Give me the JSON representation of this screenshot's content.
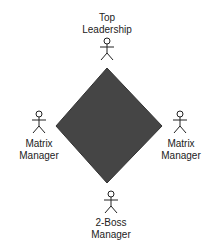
{
  "diagram": {
    "shape": "diamond",
    "fill_color": "#454545",
    "nodes": [
      {
        "id": "top",
        "role": "Top Leadership",
        "lines": [
          "Top",
          "Leadership"
        ],
        "icon": "stick-figure-icon"
      },
      {
        "id": "left",
        "role": "Matrix Manager",
        "lines": [
          "Matrix",
          "Manager"
        ],
        "icon": "stick-figure-icon"
      },
      {
        "id": "right",
        "role": "Matrix Manager",
        "lines": [
          "Matrix",
          "Manager"
        ],
        "icon": "stick-figure-icon"
      },
      {
        "id": "bottom",
        "role": "2-Boss Manager",
        "lines": [
          "2-Boss",
          "Manager"
        ],
        "icon": "stick-figure-icon"
      }
    ]
  }
}
